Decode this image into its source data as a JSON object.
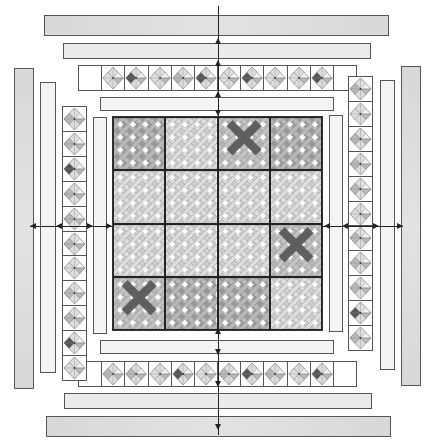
{
  "diagram": {
    "type": "quilt-assembly-layout",
    "colors": {
      "outline": "#555555",
      "border_outer": "#dcdcdc",
      "border_mid": "#ebebeb",
      "border_inner": "#f4f4f4",
      "fabric_white": "#ffffff",
      "fabric_light": "#dedede",
      "fabric_mid": "#b8b8b8",
      "fabric_medium_dark": "#9a9a9a",
      "fabric_dark": "#555555"
    },
    "center": {
      "rows": 4,
      "cols": 4,
      "block_pattern": "woven-lattice",
      "shades": [
        [
          "mid",
          "light",
          "dark-x",
          "mid"
        ],
        [
          "light",
          "light",
          "light",
          "light"
        ],
        [
          "light",
          "light",
          "light",
          "dark-x"
        ],
        [
          "dark-x",
          "mid",
          "mid",
          "light"
        ]
      ]
    },
    "top_blocks": {
      "count": 10,
      "accents": [
        "light",
        "dark",
        "light",
        "mid",
        "dark",
        "light",
        "dark",
        "light",
        "light",
        "dark"
      ]
    },
    "bottom_blocks": {
      "count": 10,
      "accents": [
        "mid",
        "mid",
        "light",
        "dark",
        "light",
        "mid",
        "dark",
        "mid",
        "light",
        "dark"
      ]
    },
    "left_blocks": {
      "count": 11,
      "accents": [
        "mid",
        "mid",
        "dark",
        "mid",
        "mid",
        "mid",
        "light",
        "mid",
        "mid",
        "dark",
        "light"
      ]
    },
    "right_blocks": {
      "count": 11,
      "accents": [
        "mid",
        "light",
        "mid",
        "mid",
        "mid",
        "light",
        "mid",
        "mid",
        "mid",
        "dark",
        "mid"
      ]
    },
    "arrows": [
      "top-vertical",
      "bottom-vertical",
      "left-horizontal",
      "right-horizontal"
    ]
  }
}
